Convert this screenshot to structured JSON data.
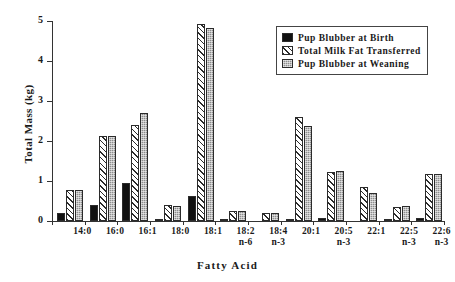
{
  "chart_data": {
    "type": "bar",
    "title": "",
    "xlabel": "Fatty Acid",
    "ylabel": "Total Mass (kg)",
    "ylim": [
      0,
      5
    ],
    "yticks": [
      0,
      1,
      2,
      3,
      4,
      5
    ],
    "ytick_labels": [
      "0",
      "1",
      "2",
      "3",
      "4",
      "5"
    ],
    "grid": false,
    "legend_position": "top-right",
    "categories": [
      "14:0",
      "16:0",
      "16:1",
      "18:0",
      "18:1",
      "18:2 n-6",
      "18:4 n-3",
      "20:1",
      "20:5 n-3",
      "22:1",
      "22:5 n-3",
      "22:6 n-3"
    ],
    "category_lines": [
      [
        "14:0",
        ""
      ],
      [
        "16:0",
        ""
      ],
      [
        "16:1",
        ""
      ],
      [
        "18:0",
        ""
      ],
      [
        "18:1",
        ""
      ],
      [
        "18:2",
        "n-6"
      ],
      [
        "18:4",
        "n-3"
      ],
      [
        "20:1",
        ""
      ],
      [
        "20:5",
        "n-3"
      ],
      [
        "22:1",
        ""
      ],
      [
        "22:5",
        "n-3"
      ],
      [
        "22:6",
        "n-3"
      ]
    ],
    "series": [
      {
        "name": "Pup Blubber at Birth",
        "pattern": "solid-black",
        "color": "#111111",
        "values": [
          0.21,
          0.39,
          0.95,
          0.02,
          0.63,
          0.02,
          0.0,
          0.01,
          0.07,
          0.0,
          0.04,
          0.07
        ]
      },
      {
        "name": "Total Milk Fat Transferred",
        "pattern": "diagonal-hatch",
        "color": "#ffffff",
        "values": [
          0.77,
          2.12,
          2.4,
          0.4,
          4.93,
          0.25,
          0.2,
          2.59,
          1.22,
          0.85,
          0.35,
          1.17
        ]
      },
      {
        "name": "Pup Blubber at Weaning",
        "pattern": "gray-stipple",
        "color": "#8d8d8d",
        "values": [
          0.78,
          2.12,
          2.7,
          0.37,
          4.83,
          0.24,
          0.2,
          2.37,
          1.24,
          0.69,
          0.38,
          1.17
        ]
      }
    ]
  }
}
